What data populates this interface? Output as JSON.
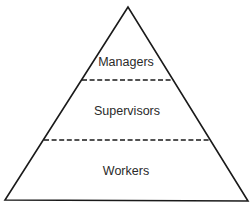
{
  "diagram": {
    "type": "hierarchy-pyramid",
    "levels": [
      {
        "label": "Managers"
      },
      {
        "label": "Supervisors"
      },
      {
        "label": "Workers"
      }
    ],
    "colors": {
      "stroke": "#1a1a1a",
      "text": "#2a2a2a",
      "background": "#ffffff"
    }
  }
}
